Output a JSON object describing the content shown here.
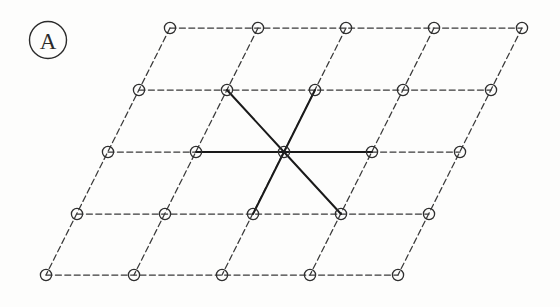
{
  "figure": {
    "panel_label": "A",
    "caption_text": "",
    "background_color": "#fdfdfc"
  },
  "colors": {
    "lattice_line": "#3a3a3a",
    "bond_line": "#1a1a1a",
    "node_stroke": "#2e2e2e",
    "node_fill": "#ffffff",
    "label_color": "#2b2b2b"
  },
  "panel_label_marker": {
    "name": "A",
    "cx": 48,
    "cy": 40,
    "r": 18.5,
    "stroke_width": 1.4
  },
  "lattice": {
    "type": "oblique-2d-bravais",
    "rows": 5,
    "cols": 5,
    "origin_x": 170,
    "origin_y": 28,
    "a_vector_x": 88,
    "a_vector_y": 0,
    "b_vector_x": -31,
    "b_vector_y": 61.7,
    "node_radius": 5.6,
    "node_stroke_width": 1.3,
    "line_style": "dashed",
    "dash_pattern": "6,3.4",
    "line_width": 1.25,
    "nodes": [
      {
        "row": 0,
        "col": 0,
        "x": 170,
        "y": 28
      },
      {
        "row": 0,
        "col": 1,
        "x": 258,
        "y": 28
      },
      {
        "row": 0,
        "col": 2,
        "x": 346,
        "y": 28
      },
      {
        "row": 0,
        "col": 3,
        "x": 434,
        "y": 28
      },
      {
        "row": 0,
        "col": 4,
        "x": 522,
        "y": 28
      },
      {
        "row": 1,
        "col": 0,
        "x": 139,
        "y": 90
      },
      {
        "row": 1,
        "col": 1,
        "x": 227,
        "y": 90
      },
      {
        "row": 1,
        "col": 2,
        "x": 315,
        "y": 90
      },
      {
        "row": 1,
        "col": 3,
        "x": 403,
        "y": 90
      },
      {
        "row": 1,
        "col": 4,
        "x": 491,
        "y": 90
      },
      {
        "row": 2,
        "col": 0,
        "x": 108,
        "y": 152
      },
      {
        "row": 2,
        "col": 1,
        "x": 196,
        "y": 152
      },
      {
        "row": 2,
        "col": 2,
        "x": 284,
        "y": 152
      },
      {
        "row": 2,
        "col": 3,
        "x": 372,
        "y": 152
      },
      {
        "row": 2,
        "col": 4,
        "x": 460,
        "y": 152
      },
      {
        "row": 3,
        "col": 0,
        "x": 77,
        "y": 214
      },
      {
        "row": 3,
        "col": 1,
        "x": 165,
        "y": 214
      },
      {
        "row": 3,
        "col": 2,
        "x": 253,
        "y": 214
      },
      {
        "row": 3,
        "col": 3,
        "x": 341,
        "y": 214
      },
      {
        "row": 3,
        "col": 4,
        "x": 429,
        "y": 214
      },
      {
        "row": 4,
        "col": 0,
        "x": 46,
        "y": 275
      },
      {
        "row": 4,
        "col": 1,
        "x": 134,
        "y": 275
      },
      {
        "row": 4,
        "col": 2,
        "x": 222,
        "y": 275
      },
      {
        "row": 4,
        "col": 3,
        "x": 310,
        "y": 275
      },
      {
        "row": 4,
        "col": 4,
        "x": 398,
        "y": 275
      }
    ],
    "dashed_rows": [
      {
        "x1": 170,
        "y1": 28,
        "x2": 522,
        "y2": 28
      },
      {
        "x1": 139,
        "y1": 90,
        "x2": 491,
        "y2": 90
      },
      {
        "x1": 108,
        "y1": 152,
        "x2": 460,
        "y2": 152
      },
      {
        "x1": 77,
        "y1": 214,
        "x2": 429,
        "y2": 214
      },
      {
        "x1": 46,
        "y1": 275,
        "x2": 398,
        "y2": 275
      }
    ],
    "dashed_cols": [
      {
        "x1": 170,
        "y1": 28,
        "x2": 46,
        "y2": 275
      },
      {
        "x1": 258,
        "y1": 28,
        "x2": 134,
        "y2": 275
      },
      {
        "x1": 346,
        "y1": 28,
        "x2": 222,
        "y2": 275
      },
      {
        "x1": 434,
        "y1": 28,
        "x2": 310,
        "y2": 275
      },
      {
        "x1": 522,
        "y1": 28,
        "x2": 398,
        "y2": 275
      }
    ]
  },
  "coordination": {
    "description": "central site bonded to six nearest neighbours",
    "coordination_number": 6,
    "center_node": {
      "row": 2,
      "col": 2,
      "x": 284,
      "y": 152
    },
    "bond_line_width": 2.0,
    "bonds": [
      {
        "label": "bond-left",
        "x1": 284,
        "y1": 152,
        "x2": 196,
        "y2": 152,
        "to_row": 2,
        "to_col": 1
      },
      {
        "label": "bond-right",
        "x1": 284,
        "y1": 152,
        "x2": 372,
        "y2": 152,
        "to_row": 2,
        "to_col": 3
      },
      {
        "label": "bond-upper-left",
        "x1": 284,
        "y1": 152,
        "x2": 227,
        "y2": 90,
        "to_row": 1,
        "to_col": 1
      },
      {
        "label": "bond-upper-right",
        "x1": 284,
        "y1": 152,
        "x2": 315,
        "y2": 90,
        "to_row": 1,
        "to_col": 2
      },
      {
        "label": "bond-lower-left",
        "x1": 284,
        "y1": 152,
        "x2": 253,
        "y2": 214,
        "to_row": 3,
        "to_col": 2
      },
      {
        "label": "bond-lower-right",
        "x1": 284,
        "y1": 152,
        "x2": 341,
        "y2": 214,
        "to_row": 3,
        "to_col": 3
      }
    ],
    "bonded_nodes": [
      {
        "row": 1,
        "col": 1,
        "x": 227,
        "y": 90
      },
      {
        "row": 1,
        "col": 2,
        "x": 315,
        "y": 90
      },
      {
        "row": 2,
        "col": 1,
        "x": 196,
        "y": 152
      },
      {
        "row": 2,
        "col": 3,
        "x": 372,
        "y": 152
      },
      {
        "row": 3,
        "col": 2,
        "x": 253,
        "y": 214
      },
      {
        "row": 3,
        "col": 3,
        "x": 341,
        "y": 214
      }
    ]
  }
}
